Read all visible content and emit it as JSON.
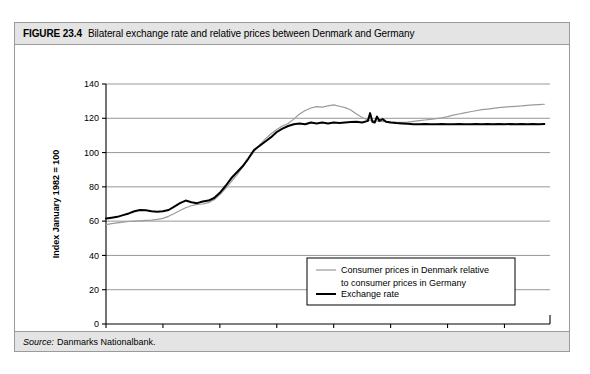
{
  "figure": {
    "label": "FIGURE 23.4",
    "caption": "Bilateral exchange rate and relative prices between Denmark and Germany",
    "source_prefix": "Source:",
    "source_text": "Danmarks Nationalbank."
  },
  "colors": {
    "frame": "#9a9a9a",
    "title_bar_background": "#e4e4e4",
    "grid": "#8c8c8c",
    "axis": "#000000",
    "series_relative_prices": "#9a9a9a",
    "series_exchange_rate": "#000000",
    "plot_background": "#ffffff"
  },
  "chart_data": {
    "type": "line",
    "title": "Bilateral exchange rate and relative prices between Denmark and Germany",
    "xlabel": "",
    "ylabel": "Index January 1982 = 100",
    "xlim": [
      1970,
      2009
    ],
    "ylim": [
      0,
      140
    ],
    "yticks": [
      0,
      20,
      40,
      60,
      80,
      100,
      120,
      140
    ],
    "xticks": [
      1970,
      1975,
      1980,
      1985,
      1990,
      1995,
      2000,
      2005
    ],
    "ytick_labels": [
      "0",
      "20",
      "40",
      "60",
      "80",
      "100",
      "120",
      "140"
    ],
    "xtick_labels": [
      "1970",
      "1975",
      "1980",
      "1985",
      "1990",
      "1995",
      "2000",
      "2005"
    ],
    "grid": "horizontal",
    "legend_position": "center-right-inside",
    "series": [
      {
        "name": "Consumer prices in Denmark relative to consumer prices in Germany",
        "color": "#9a9a9a",
        "width": 1.2,
        "x": [
          1970.0,
          1970.5,
          1971.0,
          1971.5,
          1972.0,
          1972.5,
          1973.0,
          1973.5,
          1974.0,
          1974.5,
          1975.0,
          1975.5,
          1976.0,
          1976.5,
          1977.0,
          1977.5,
          1978.0,
          1978.5,
          1979.0,
          1979.5,
          1980.0,
          1980.5,
          1981.0,
          1981.5,
          1982.0,
          1982.5,
          1983.0,
          1983.5,
          1984.0,
          1984.5,
          1985.0,
          1985.5,
          1986.0,
          1986.5,
          1987.0,
          1987.5,
          1988.0,
          1988.5,
          1989.0,
          1989.5,
          1990.0,
          1990.5,
          1991.0,
          1991.5,
          1992.0,
          1992.5,
          1993.0,
          1993.5,
          1994.0,
          1994.5,
          1995.0,
          1995.5,
          1996.0,
          1996.5,
          1997.0,
          1997.5,
          1998.0,
          1998.5,
          1999.0,
          1999.5,
          2000.0,
          2000.5,
          2001.0,
          2001.5,
          2002.0,
          2002.5,
          2003.0,
          2003.5,
          2004.0,
          2004.5,
          2005.0,
          2005.5,
          2006.0,
          2006.5,
          2007.0,
          2007.5,
          2008.0,
          2008.5
        ],
        "y": [
          58.0,
          58.5,
          59.0,
          59.4,
          59.8,
          60.0,
          60.2,
          60.4,
          60.6,
          61.0,
          61.6,
          62.8,
          64.5,
          66.2,
          67.8,
          69.0,
          69.8,
          70.0,
          70.8,
          72.5,
          75.5,
          79.0,
          83.0,
          87.0,
          91.5,
          96.0,
          100.5,
          104.5,
          108.0,
          111.0,
          113.5,
          115.5,
          117.0,
          119.5,
          122.5,
          124.5,
          126.0,
          126.8,
          126.5,
          127.2,
          127.8,
          127.0,
          126.2,
          124.8,
          122.5,
          120.5,
          119.0,
          118.6,
          118.2,
          118.0,
          117.8,
          117.6,
          117.6,
          117.8,
          118.2,
          118.6,
          119.0,
          119.4,
          119.8,
          120.3,
          121.0,
          121.8,
          122.5,
          123.2,
          123.8,
          124.4,
          125.0,
          125.4,
          125.8,
          126.2,
          126.5,
          126.8,
          127.0,
          127.2,
          127.5,
          127.8,
          128.0,
          128.2
        ]
      },
      {
        "name": "Exchange rate",
        "color": "#000000",
        "width": 2.0,
        "x": [
          1970.0,
          1970.5,
          1971.0,
          1971.5,
          1972.0,
          1972.5,
          1973.0,
          1973.5,
          1974.0,
          1974.5,
          1975.0,
          1975.5,
          1976.0,
          1976.5,
          1977.0,
          1977.5,
          1978.0,
          1978.5,
          1979.0,
          1979.5,
          1980.0,
          1980.5,
          1981.0,
          1981.5,
          1982.0,
          1982.5,
          1983.0,
          1983.5,
          1984.0,
          1984.5,
          1985.0,
          1985.5,
          1986.0,
          1986.5,
          1987.0,
          1987.5,
          1988.0,
          1988.5,
          1989.0,
          1989.5,
          1990.0,
          1990.5,
          1991.0,
          1991.5,
          1992.0,
          1992.5,
          1993.0,
          1993.2,
          1993.4,
          1993.6,
          1993.8,
          1994.0,
          1994.3,
          1994.6,
          1995.0,
          1995.5,
          1996.0,
          1996.5,
          1997.0,
          1997.5,
          1998.0,
          1998.5,
          1999.0,
          1999.5,
          2000.0,
          2000.5,
          2001.0,
          2001.5,
          2002.0,
          2002.5,
          2003.0,
          2003.5,
          2004.0,
          2004.5,
          2005.0,
          2005.5,
          2006.0,
          2006.5,
          2007.0,
          2007.5,
          2008.0,
          2008.5
        ],
        "y": [
          61.5,
          62.0,
          62.5,
          63.5,
          64.5,
          65.8,
          66.5,
          66.3,
          65.8,
          65.5,
          65.8,
          66.5,
          68.5,
          70.5,
          72.0,
          71.0,
          70.5,
          71.5,
          72.0,
          73.5,
          76.5,
          80.5,
          85.0,
          88.5,
          92.0,
          96.5,
          101.5,
          104.0,
          106.5,
          109.0,
          112.0,
          114.0,
          115.5,
          116.5,
          117.0,
          116.5,
          117.5,
          117.0,
          117.5,
          117.0,
          117.5,
          117.2,
          117.5,
          117.8,
          118.0,
          117.5,
          118.5,
          123.0,
          118.0,
          117.5,
          121.0,
          118.5,
          119.5,
          118.0,
          117.5,
          117.2,
          117.0,
          116.8,
          116.5,
          116.5,
          116.6,
          116.5,
          116.5,
          116.6,
          116.5,
          116.5,
          116.6,
          116.5,
          116.5,
          116.6,
          116.5,
          116.6,
          116.5,
          116.6,
          116.5,
          116.6,
          116.5,
          116.6,
          116.5,
          116.6,
          116.5,
          116.6
        ]
      }
    ],
    "legend": [
      {
        "label_line1": "Consumer prices in Denmark relative",
        "label_line2": "to consumer prices in Germany",
        "color": "#9a9a9a",
        "width": 1.2
      },
      {
        "label_line1": "Exchange rate",
        "label_line2": "",
        "color": "#000000",
        "width": 2.0
      }
    ]
  }
}
